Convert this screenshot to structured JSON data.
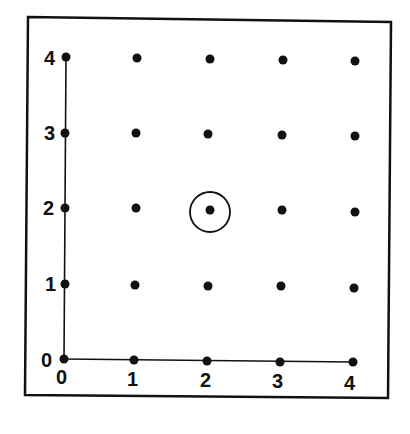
{
  "diagram": {
    "type": "lattice-grid",
    "x_axis": {
      "ticks": [
        "0",
        "1",
        "2",
        "3",
        "4"
      ]
    },
    "y_axis": {
      "ticks": [
        "0",
        "1",
        "2",
        "3",
        "4"
      ]
    },
    "grid_points": [
      [
        0,
        0
      ],
      [
        1,
        0
      ],
      [
        2,
        0
      ],
      [
        3,
        0
      ],
      [
        4,
        0
      ],
      [
        0,
        1
      ],
      [
        1,
        1
      ],
      [
        2,
        1
      ],
      [
        3,
        1
      ],
      [
        4,
        1
      ],
      [
        0,
        2
      ],
      [
        1,
        2
      ],
      [
        2,
        2
      ],
      [
        3,
        2
      ],
      [
        4,
        2
      ],
      [
        0,
        3
      ],
      [
        1,
        3
      ],
      [
        2,
        3
      ],
      [
        3,
        3
      ],
      [
        4,
        3
      ],
      [
        0,
        4
      ],
      [
        1,
        4
      ],
      [
        2,
        4
      ],
      [
        3,
        4
      ],
      [
        4,
        4
      ]
    ],
    "highlighted_point": [
      2,
      2
    ],
    "highlight_shape": "circle",
    "colors": {
      "ink": "#111111",
      "background": "#ffffff"
    }
  }
}
